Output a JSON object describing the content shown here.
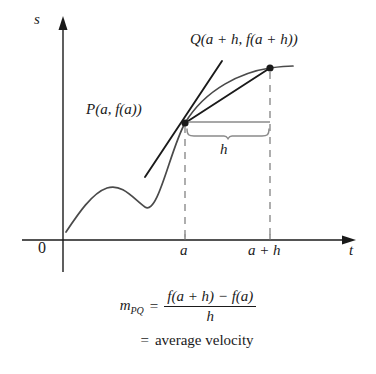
{
  "figure": {
    "type": "calculus-secant-diagram",
    "axes": {
      "vertical_label": "s",
      "horizontal_label": "t",
      "origin_label": "0",
      "tick_labels": [
        "a",
        "a + h"
      ]
    },
    "points": [
      {
        "name": "P",
        "label": "P(a, f(a))"
      },
      {
        "name": "Q",
        "label": "Q(a + h, f(a + h))"
      }
    ],
    "interval_label": "h",
    "colors": {
      "ink": "#1a1a1a",
      "curve": "#4a4a4a",
      "dashed_guide": "#9a9a9a",
      "bracket": "#8a8a8a"
    }
  },
  "formula": {
    "slope_symbol": "m",
    "slope_subscript": "PQ",
    "equals": "=",
    "numerator": "f(a + h) − f(a)",
    "denominator": "h",
    "equals2": "=",
    "result_text": "average velocity"
  }
}
